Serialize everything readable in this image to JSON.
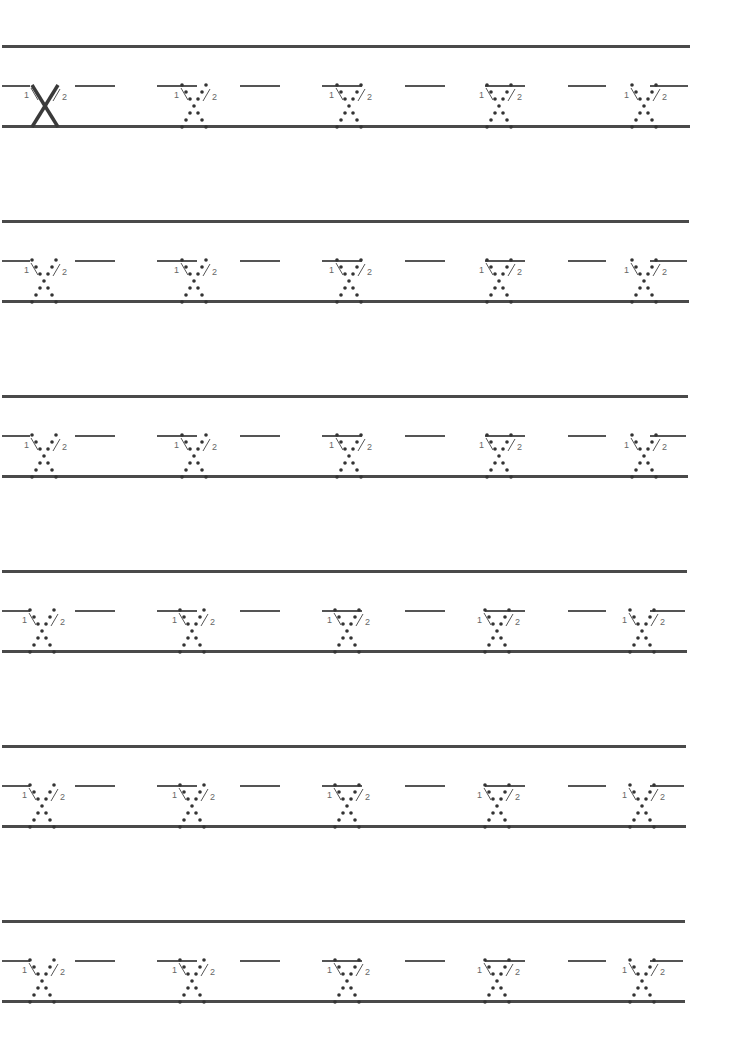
{
  "worksheet": {
    "letter": "X",
    "stroke_labels": [
      "1",
      "2"
    ],
    "line_color": "#4a4a4a",
    "rows": [
      {
        "top": 45,
        "cells": [
          "solid",
          "dotted",
          "dotted",
          "dotted",
          "dotted"
        ]
      },
      {
        "top": 220,
        "cells": [
          "dotted",
          "dotted",
          "dotted",
          "dotted",
          "dotted"
        ]
      },
      {
        "top": 395,
        "cells": [
          "dotted",
          "dotted",
          "dotted",
          "dotted",
          "dotted"
        ]
      },
      {
        "top": 570,
        "cells": [
          "dotted",
          "dotted",
          "dotted",
          "dotted",
          "dotted"
        ]
      },
      {
        "top": 745,
        "cells": [
          "dotted",
          "dotted",
          "dotted",
          "dotted",
          "dotted"
        ]
      },
      {
        "top": 920,
        "cells": [
          "dotted",
          "dotted",
          "dotted",
          "dotted",
          "dotted"
        ]
      }
    ],
    "cell_x": [
      10,
      160,
      315,
      465,
      610
    ]
  }
}
